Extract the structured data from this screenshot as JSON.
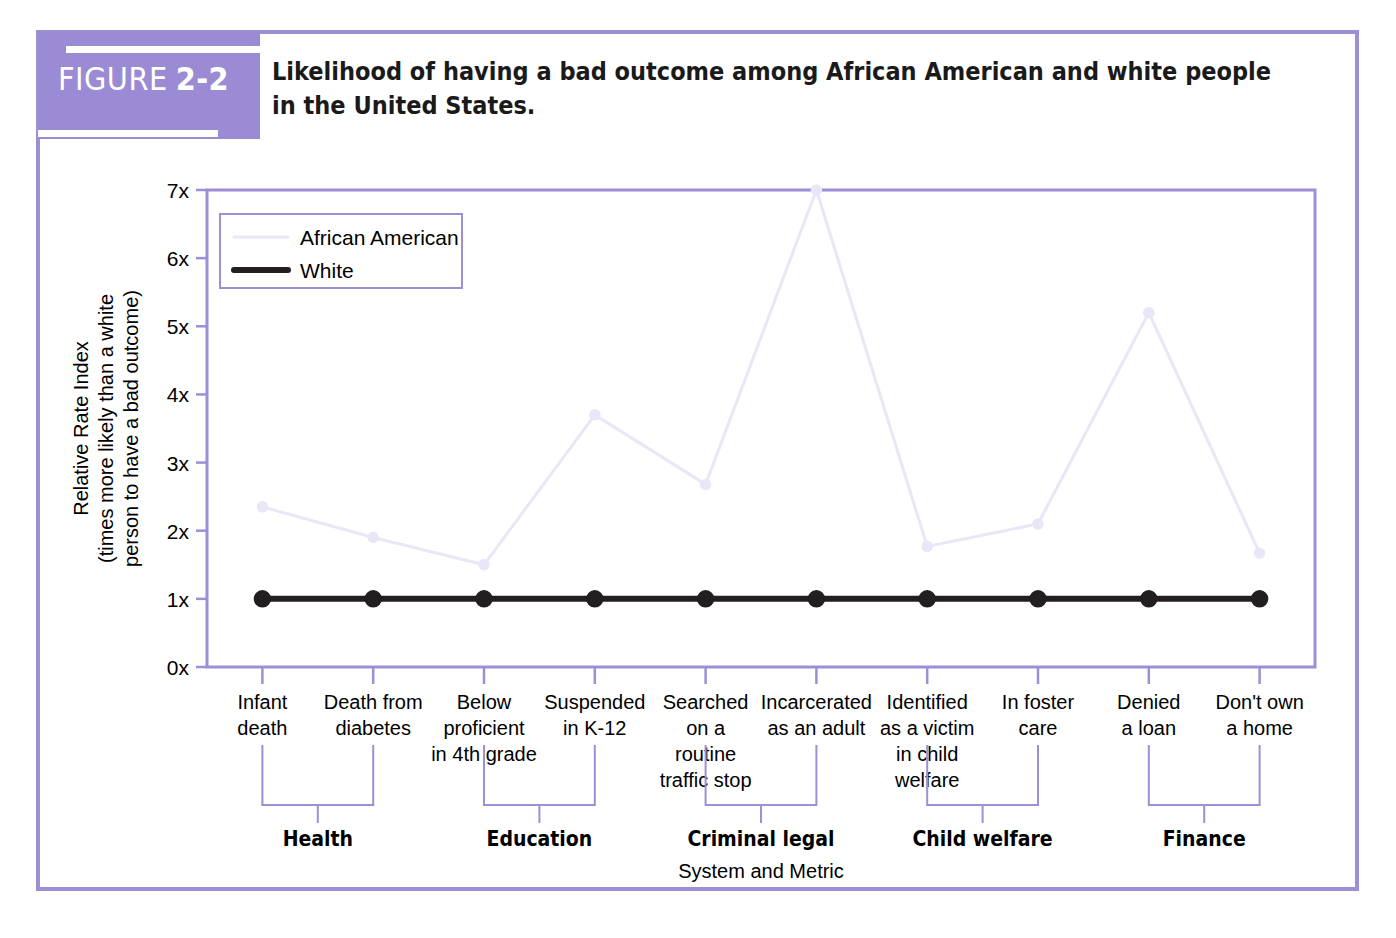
{
  "figure": {
    "badge_word": "FIGURE",
    "badge_number": "2-2",
    "title_line1": "Likelihood of having a bad outcome among African American and white people in the",
    "title_line2": "United States.",
    "badge_color": "#9b8bd5",
    "frame_color": "#9d8ed6"
  },
  "legend": {
    "position": "top-left-inside",
    "entries": [
      {
        "label": "African American",
        "color": "#e9e6f7"
      },
      {
        "label": "White",
        "color": "#231f20"
      }
    ]
  },
  "chart_data": {
    "type": "line",
    "title": "Likelihood of having a bad outcome among African American and white people in the United States.",
    "xlabel": "System and Metric",
    "ylabel": "Relative Rate Index (times more likely than a white person to have a bad outcome)",
    "ylabel_line1": "Relative Rate Index",
    "ylabel_line2": "(times more likely than a white",
    "ylabel_line3": "person to have a bad outcome)",
    "ylim": [
      0,
      7.3
    ],
    "yticks": [
      0,
      1,
      2,
      3,
      4,
      5,
      6,
      7
    ],
    "ytick_labels": [
      "0x",
      "1x",
      "2x",
      "3x",
      "4x",
      "5x",
      "6x",
      "7x"
    ],
    "grid": false,
    "legend": [
      "African American",
      "White"
    ],
    "categories": [
      "Infant\ndeath",
      "Death from\ndiabetes",
      "Below\nproficient\nin 4th grade",
      "Suspended\nin K-12",
      "Searched\non a\nroutine\ntraffic stop",
      "Incarcerated\nas an adult",
      "Identified\nas a victim\nin child\nwelfare",
      "In foster\ncare",
      "Denied\na loan",
      "Don't own\na home"
    ],
    "category_lines": [
      [
        "Infant",
        "death"
      ],
      [
        "Death from",
        "diabetes"
      ],
      [
        "Below",
        "proficient",
        "in 4th grade"
      ],
      [
        "Suspended",
        "in K-12"
      ],
      [
        "Searched",
        "on a",
        "routine",
        "traffic stop"
      ],
      [
        "Incarcerated",
        "as an adult"
      ],
      [
        "Identified",
        "as a victim",
        "in child",
        "welfare"
      ],
      [
        "In foster",
        "care"
      ],
      [
        "Denied",
        "a loan"
      ],
      [
        "Don't own",
        "a home"
      ]
    ],
    "series": [
      {
        "name": "African American",
        "color": "#e9e6f7",
        "values": [
          2.35,
          1.9,
          1.5,
          3.7,
          2.68,
          7.0,
          1.77,
          2.1,
          5.2,
          1.67
        ]
      },
      {
        "name": "White",
        "color": "#231f20",
        "values": [
          1.0,
          1.0,
          1.0,
          1.0,
          1.0,
          1.0,
          1.0,
          1.0,
          1.0,
          1.0
        ]
      }
    ],
    "groups": [
      {
        "label": "Health",
        "first": 0,
        "last": 1
      },
      {
        "label": "Education",
        "first": 2,
        "last": 3
      },
      {
        "label": "Criminal legal",
        "first": 4,
        "last": 5
      },
      {
        "label": "Child welfare",
        "first": 6,
        "last": 7
      },
      {
        "label": "Finance",
        "first": 8,
        "last": 9
      }
    ]
  }
}
